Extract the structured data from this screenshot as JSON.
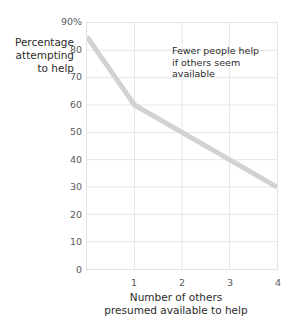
{
  "chart_data": {
    "type": "line",
    "title": "",
    "xlabel": "Number of others presumed available to help",
    "ylabel": "Percentage attempting to help",
    "x": [
      0,
      1,
      2,
      3,
      4
    ],
    "values": [
      85,
      60,
      50,
      40,
      30
    ],
    "series": [
      {
        "name": "Percentage attempting to help",
        "values": [
          85,
          60,
          50,
          40,
          30
        ]
      }
    ],
    "xlim": [
      0,
      4
    ],
    "ylim": [
      0,
      90
    ],
    "grid": true,
    "legend": "none",
    "line_color": "#d2d2d2",
    "grid_color": "#e6e6e6",
    "frame_color": "#e2e2e2",
    "annotations": [
      {
        "text": "Fewer people help if others seem available",
        "lines": [
          "Fewer people help",
          "if others seem",
          "available"
        ]
      }
    ]
  },
  "y_axis": {
    "caption_lines": [
      "Percentage",
      "attempting",
      "to help"
    ],
    "ticks": [
      {
        "label": "90%",
        "value": 90
      },
      {
        "label": "80",
        "value": 80
      },
      {
        "label": "70",
        "value": 70
      },
      {
        "label": "60",
        "value": 60
      },
      {
        "label": "50",
        "value": 50
      },
      {
        "label": "40",
        "value": 40
      },
      {
        "label": "30",
        "value": 30
      },
      {
        "label": "20",
        "value": 20
      },
      {
        "label": "10",
        "value": 10
      },
      {
        "label": "0",
        "value": 0
      }
    ]
  },
  "x_axis": {
    "caption_lines": [
      "Number of others",
      "presumed available to help"
    ],
    "ticks": [
      {
        "label": "1",
        "value": 1
      },
      {
        "label": "2",
        "value": 2
      },
      {
        "label": "3",
        "value": 3
      },
      {
        "label": "4",
        "value": 4
      }
    ]
  },
  "annotation": {
    "line1": "Fewer people help",
    "line2": "if others seem",
    "line3": "available"
  }
}
